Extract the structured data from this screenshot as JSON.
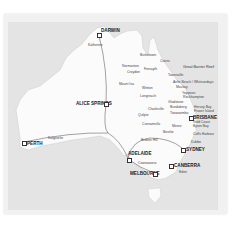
{
  "map": {
    "title": "Australia route map",
    "colors": {
      "land": "#fbfbfb",
      "sea": "#e4e4e4",
      "route": "#666666",
      "text": "#333333"
    },
    "major_cities": [
      {
        "name": "DARWIN",
        "x": 98,
        "y": 34
      },
      {
        "name": "ALICE SPRINGS",
        "x": 105,
        "y": 103
      },
      {
        "name": "PERTH",
        "x": 23,
        "y": 142
      },
      {
        "name": "ADELAIDE",
        "x": 128,
        "y": 159
      },
      {
        "name": "MELBOURNE",
        "x": 154,
        "y": 174
      },
      {
        "name": "CANBERRA",
        "x": 170,
        "y": 166
      },
      {
        "name": "SYDNEY",
        "x": 182,
        "y": 149
      },
      {
        "name": "BRISBANE",
        "x": 190,
        "y": 117
      }
    ],
    "towns": [
      {
        "name": "Katherine",
        "x": 97,
        "y": 44
      },
      {
        "name": "Kalgoorlie",
        "x": 46,
        "y": 137
      },
      {
        "name": "Burketown",
        "x": 145,
        "y": 57
      },
      {
        "name": "Cairns",
        "x": 159,
        "y": 61
      },
      {
        "name": "Normanton",
        "x": 134,
        "y": 66
      },
      {
        "name": "Croydon",
        "x": 134,
        "y": 72
      },
      {
        "name": "Forsayth",
        "x": 149,
        "y": 70
      },
      {
        "name": "Townsville",
        "x": 167,
        "y": 75
      },
      {
        "name": "Mount Isa",
        "x": 131,
        "y": 83
      },
      {
        "name": "Airlie Beach / Whitsundays",
        "x": 172,
        "y": 82
      },
      {
        "name": "Mackay",
        "x": 175,
        "y": 87
      },
      {
        "name": "Winton",
        "x": 146,
        "y": 88
      },
      {
        "name": "Longreach",
        "x": 148,
        "y": 95
      },
      {
        "name": "Yeppoon",
        "x": 181,
        "y": 93
      },
      {
        "name": "Rockhampton",
        "x": 182,
        "y": 97
      },
      {
        "name": "Gladstone",
        "x": 180,
        "y": 102
      },
      {
        "name": "Bundaberg",
        "x": 186,
        "y": 107
      },
      {
        "name": "Hervey Bay",
        "x": 192,
        "y": 107
      },
      {
        "name": "Fraser Island",
        "x": 193,
        "y": 111
      },
      {
        "name": "Charleville",
        "x": 157,
        "y": 110
      },
      {
        "name": "Quilpie",
        "x": 147,
        "y": 114
      },
      {
        "name": "Toowoomba",
        "x": 182,
        "y": 113
      },
      {
        "name": "Gold Coast",
        "x": 191,
        "y": 121
      },
      {
        "name": "Cunnamulla",
        "x": 155,
        "y": 124
      },
      {
        "name": "Moree",
        "x": 179,
        "y": 126
      },
      {
        "name": "Byron Bay",
        "x": 192,
        "y": 126
      },
      {
        "name": "Bourke",
        "x": 165,
        "y": 132
      },
      {
        "name": "Coffs Harbour",
        "x": 191,
        "y": 134
      },
      {
        "name": "Broken Hill",
        "x": 149,
        "y": 139
      },
      {
        "name": "Dubbo",
        "x": 190,
        "y": 141
      },
      {
        "name": "Coonawarra",
        "x": 155,
        "y": 163
      },
      {
        "name": "Eden",
        "x": 180,
        "y": 173
      }
    ],
    "regions": [
      {
        "name": "Great Barrier Reef",
        "x": 181,
        "y": 66
      }
    ]
  }
}
